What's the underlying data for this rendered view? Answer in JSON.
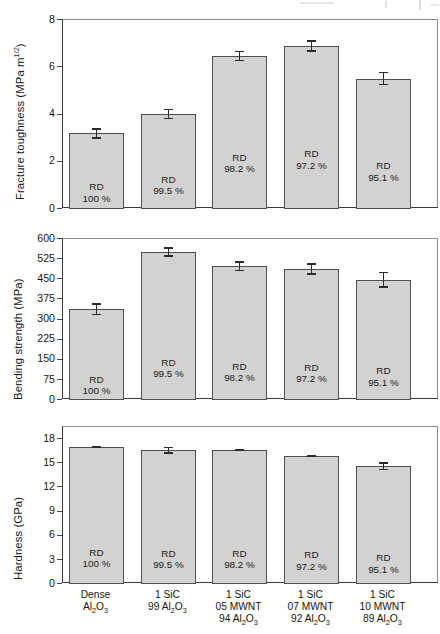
{
  "figure": {
    "kind": "multi-panel-bar-chart",
    "panel_count": 3,
    "bar_fill_color": "#d2d2d2",
    "bar_border_color": "#4e4e4e",
    "error_bar_color": "#2b2b2b",
    "background_color": "#ffffff"
  },
  "categories": [
    {
      "line1": "Dense",
      "line2": "Al",
      "line2_sub": "2",
      "line2_b": "O",
      "line2_sub_b": "3",
      "line3": ""
    },
    {
      "line1": "1 SiC",
      "line2": "99 Al",
      "line2_sub": "2",
      "line2_b": "O",
      "line2_sub_b": "3",
      "line3": ""
    },
    {
      "line1": "1 SiC",
      "line2": "05 MWNT",
      "line3": "94 Al",
      "line3_sub": "2",
      "line3_b": "O",
      "line3_sub_b": "3"
    },
    {
      "line1": "1 SiC",
      "line2": "07 MWNT",
      "line3": "92 Al",
      "line3_sub": "2",
      "line3_b": "O",
      "line3_sub_b": "3"
    },
    {
      "line1": "1 SiC",
      "line2": "10 MWNT",
      "line3": "89 Al",
      "line3_sub": "2",
      "line3_b": "O",
      "line3_sub_b": "3"
    }
  ],
  "rd_labels": [
    {
      "title": "RD",
      "value": "100 %"
    },
    {
      "title": "RD",
      "value": "99.5 %"
    },
    {
      "title": "RD",
      "value": "98.2 %"
    },
    {
      "title": "RD",
      "value": "97.2 %"
    },
    {
      "title": "RD",
      "value": "95.1 %"
    }
  ],
  "chart_data": [
    {
      "type": "bar",
      "panel": "fracture-toughness",
      "title": "",
      "xlabel": "",
      "ylabel": "Fracture toughness (MPa m1/2)",
      "ylabel_base": "Fracture toughness (MPa m",
      "ylabel_sup": "1/2",
      "ylabel_tail": ")",
      "ylim": [
        0,
        8
      ],
      "yticks": [
        0,
        2,
        4,
        6,
        8
      ],
      "ytick_labels": [
        "0",
        "2",
        "4",
        "6",
        "8"
      ],
      "grid": false,
      "legend": "none",
      "categories": [
        "Dense Al2O3",
        "1 SiC 99 Al2O3",
        "1 SiC 05 MWNT 94 Al2O3",
        "1 SiC 07 MWNT 92 Al2O3",
        "1 SiC 10 MWNT 89 Al2O3"
      ],
      "values": [
        3.2,
        4.02,
        6.48,
        6.9,
        5.52
      ],
      "errors": [
        0.22,
        0.22,
        0.22,
        0.25,
        0.28
      ]
    },
    {
      "type": "bar",
      "panel": "bending-strength",
      "title": "",
      "xlabel": "",
      "ylabel": "Bending strength (MPa)",
      "ylim": [
        0,
        600
      ],
      "yticks": [
        0,
        75,
        150,
        225,
        300,
        375,
        450,
        525,
        600
      ],
      "ytick_labels": [
        "0",
        "75",
        "150",
        "225",
        "300",
        "375",
        "450",
        "525",
        "600"
      ],
      "grid": false,
      "legend": "none",
      "categories": [
        "Dense Al2O3",
        "1 SiC 99 Al2O3",
        "1 SiC 05 MWNT 94 Al2O3",
        "1 SiC 07 MWNT 92 Al2O3",
        "1 SiC 10 MWNT 89 Al2O3"
      ],
      "values": [
        338,
        552,
        498,
        488,
        448
      ],
      "errors": [
        22,
        18,
        19,
        21,
        30
      ]
    },
    {
      "type": "bar",
      "panel": "hardness",
      "title": "",
      "xlabel": "",
      "ylabel": "Hardness (GPa)",
      "ylim": [
        0,
        19.5
      ],
      "yticks": [
        0,
        3,
        6,
        9,
        12,
        15,
        18
      ],
      "ytick_labels": [
        "0",
        "3",
        "6",
        "9",
        "12",
        "15",
        "18"
      ],
      "grid": false,
      "legend": "none",
      "categories": [
        "Dense Al2O3",
        "1 SiC 99 Al2O3",
        "1 SiC 05 MWNT 94 Al2O3",
        "1 SiC 07 MWNT 92 Al2O3",
        "1 SiC 10 MWNT 89 Al2O3"
      ],
      "values": [
        17.0,
        16.6,
        16.6,
        15.9,
        14.6
      ],
      "errors": [
        0.12,
        0.42,
        0.13,
        0.14,
        0.5
      ]
    }
  ]
}
